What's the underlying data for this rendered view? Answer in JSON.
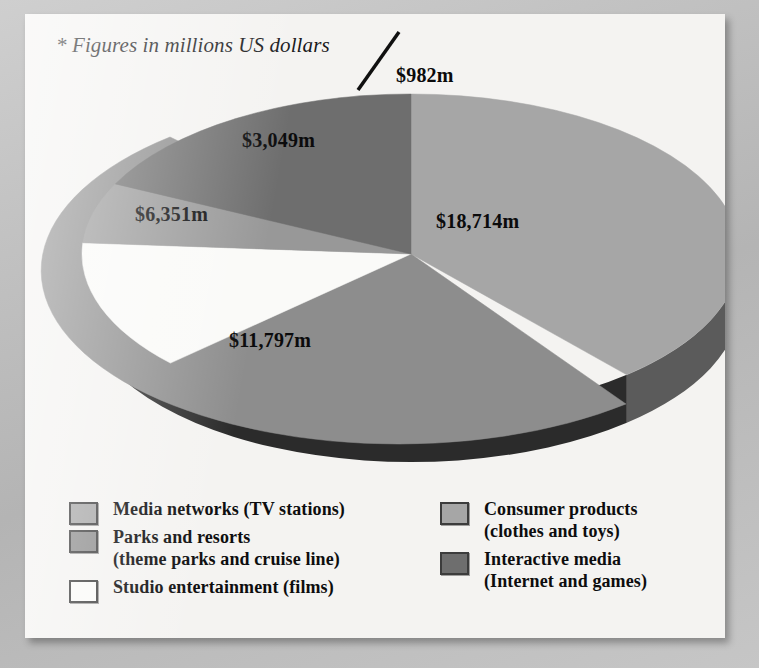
{
  "footnote": "* Figures in millions US dollars",
  "colors": {
    "card_bg": "#f4f3f1",
    "media_networks": "#a6a6a6",
    "parks_resorts": "#8d8d8d",
    "studio_entertainment": "#fafaf8",
    "consumer_products": "#989898",
    "interactive_media": "#6e6e6e",
    "side_wall_dark": "#2b2b2b",
    "side_wall_mid": "#5b5b5b",
    "label_text": "#0b0b0c"
  },
  "chart_data": {
    "type": "pie",
    "title": "",
    "subtitle": "",
    "xlabel": "",
    "ylabel": "",
    "note": "* Figures in millions US dollars",
    "units": "millions US dollars",
    "legend_position": "bottom",
    "grid": false,
    "categories": [
      "Media networks (TV stations)",
      "Parks and resorts (theme parks and cruise line)",
      "Studio entertainment (films)",
      "Consumer products (clothes and toys)",
      "Interactive media (Internet and games)"
    ],
    "values": [
      18714,
      11797,
      6351,
      3049,
      982
    ],
    "labels": [
      "$18,714m",
      "$11,797m",
      "$6,351m",
      "$3,049m",
      "$982m"
    ],
    "total": 40893,
    "slices": [
      {
        "name": "Media networks (TV stations)",
        "value": 18714,
        "label": "$18,714m",
        "color": "#a6a6a6",
        "start_deg": 0,
        "end_deg": 139,
        "percent": 45.8
      },
      {
        "name": "Parks and resorts (theme parks and cruise line)",
        "value": 11797,
        "label": "$11,797m",
        "color": "#8d8d8d",
        "start_deg": 139,
        "end_deg": 227,
        "percent": 28.8
      },
      {
        "name": "Studio entertainment (films)",
        "value": 6351,
        "label": "$6,351m",
        "color": "#fafaf8",
        "start_deg": 227,
        "end_deg": 274,
        "percent": 15.5
      },
      {
        "name": "Consumer products (clothes and toys)",
        "value": 3049,
        "label": "$3,049m",
        "color": "#989898",
        "start_deg": 274,
        "end_deg": 296,
        "percent": 7.5
      },
      {
        "name": "Interactive media (Internet and games)",
        "value": 982,
        "label": "$982m",
        "color": "#6e6e6e",
        "start_deg": 296,
        "end_deg": 360,
        "percent": 2.4
      }
    ]
  },
  "value_labels": {
    "media_networks": "$18,714m",
    "parks_resorts": "$11,797m",
    "studio_entertainment": "$6,351m",
    "consumer_products": "$3,049m",
    "interactive_media": "$982m"
  },
  "legend": {
    "left": [
      {
        "label_line1": "Media networks (TV stations)",
        "label_line2": "",
        "color": "#a6a6a6"
      },
      {
        "label_line1": "Parks and resorts",
        "label_line2": "(theme parks and cruise line)",
        "color": "#8d8d8d"
      },
      {
        "label_line1": "Studio entertainment (films)",
        "label_line2": "",
        "color": "#fafaf8"
      }
    ],
    "right": [
      {
        "label_line1": "Consumer products",
        "label_line2": "(clothes and toys)",
        "color": "#a6a6a6"
      },
      {
        "label_line1": "Interactive media",
        "label_line2": "(Internet and games)",
        "color": "#6e6e6e"
      }
    ]
  }
}
